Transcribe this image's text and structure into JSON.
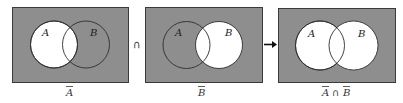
{
  "colors": {
    "shaded": "#8e8e8e",
    "unshaded": "#ffffff",
    "border": "#3a3a3a",
    "circle_stroke": "#2e2e2e"
  },
  "panels": [
    {
      "id": "complement-a",
      "caption": "A",
      "caption_overbar": true,
      "set_labels": {
        "a": "A",
        "b": "B"
      },
      "shaded_region": "everything outside A",
      "unshaded_region": "A"
    },
    {
      "id": "complement-b",
      "caption": "B",
      "caption_overbar": true,
      "set_labels": {
        "a": "A",
        "b": "B"
      },
      "shaded_region": "everything outside B",
      "unshaded_region": "B"
    },
    {
      "id": "complement-a-intersect-complement-b",
      "caption_parts": [
        "A",
        "∩",
        "B"
      ],
      "caption_overbar": true,
      "set_labels": {
        "a": "A",
        "b": "B"
      },
      "shaded_region": "outside both A and B",
      "unshaded_region": "A ∪ B"
    }
  ],
  "operators": {
    "intersection": "∩",
    "arrow": "→"
  }
}
